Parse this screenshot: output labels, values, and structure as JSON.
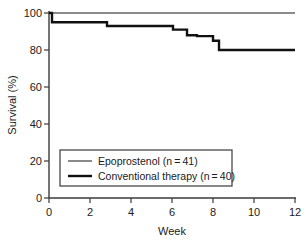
{
  "chart_data": {
    "type": "line",
    "title": "",
    "subtitle": "",
    "xlabel": "Week",
    "ylabel": "Survival (%)",
    "xlim": [
      0,
      12.3
    ],
    "ylim": [
      0,
      100
    ],
    "xticks": [
      "0",
      "2",
      "4",
      "6",
      "8",
      "10",
      "12"
    ],
    "xtick_values": [
      0,
      2,
      4,
      6,
      8,
      10,
      12
    ],
    "yticks": [
      "0",
      "20",
      "40",
      "60",
      "80",
      "100"
    ],
    "ytick_values": [
      0,
      20,
      40,
      60,
      80,
      100
    ],
    "grid": false,
    "legend_position": "lower-left-inside",
    "step_style": "post",
    "series": [
      {
        "name": "Epoprostenol (n = 41)",
        "color": "#8a8a8a",
        "line_width": 2.0,
        "x": [
          0,
          12.3
        ],
        "values": [
          100,
          100
        ]
      },
      {
        "name": "Conventional therapy (n = 40)",
        "color": "#111111",
        "line_width": 2.4,
        "x": [
          0,
          0.15,
          2.9,
          6.2,
          6.9,
          7.4,
          8.2,
          8.5,
          12.3
        ],
        "values": [
          100,
          95,
          93,
          91,
          88,
          87.5,
          85,
          80,
          80
        ]
      }
    ]
  },
  "axes": {
    "y_axis_label": "Survival (%)",
    "x_axis_label": "Week"
  },
  "legend": {
    "entries": [
      {
        "label": "Epoprostenol (n = 41)",
        "swatch_color": "#8a8a8a"
      },
      {
        "label": "Conventional therapy (n = 40)",
        "swatch_color": "#111111"
      }
    ]
  }
}
